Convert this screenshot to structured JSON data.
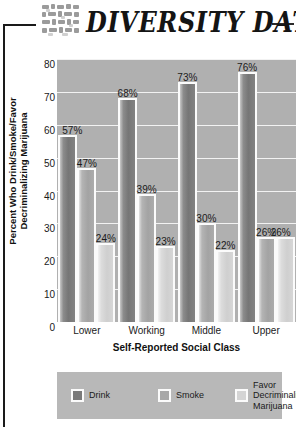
{
  "header": {
    "brand_title": "DIVERSITY DATA",
    "logo_name": "mosaic-blocks-logo"
  },
  "chart_data": {
    "type": "bar",
    "title": "",
    "subtitle": "",
    "xlabel": "Self-Reported Social Class",
    "ylabel": "Percent Who Drink/Smoke/Favor Decriminalizing Marijuana",
    "categories": [
      "Lower",
      "Working",
      "Middle",
      "Upper"
    ],
    "series": [
      {
        "name": "Drink",
        "color": "#7a7a7a",
        "values": [
          57,
          68,
          73,
          76
        ]
      },
      {
        "name": "Smoke",
        "color": "#a8a8a8",
        "values": [
          47,
          39,
          30,
          26
        ]
      },
      {
        "name": "Favor Decriminalizing Marijuana",
        "color": "#d4d4d4",
        "values": [
          24,
          23,
          22,
          26
        ]
      }
    ],
    "value_labels": [
      [
        "57%",
        "68%",
        "73%",
        "76%"
      ],
      [
        "47%",
        "39%",
        "30%",
        "26%"
      ],
      [
        "24%",
        "23%",
        "22%",
        "26%"
      ]
    ],
    "ylim": [
      0,
      80
    ],
    "yticks": [
      80,
      70,
      60,
      50,
      40,
      30,
      20,
      10,
      0
    ],
    "ytick_labels": [
      "80",
      "70",
      "60",
      "50",
      "40",
      "30",
      "20",
      "10",
      "0"
    ],
    "grid": true,
    "grid_color": "#f2f2f2",
    "plot_background": "#b0b0b0",
    "legend_position": "bottom",
    "legend_background": "#b8b8b8",
    "legend_labels": [
      "Drink",
      "Smoke",
      "Favor\nDecriminalizing\nMarijuana"
    ]
  }
}
